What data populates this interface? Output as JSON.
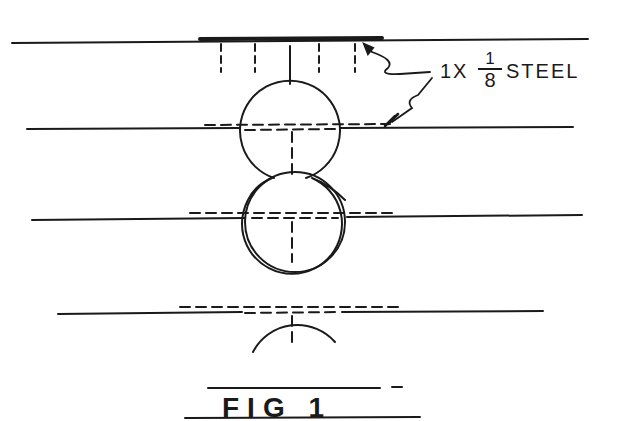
{
  "drawing": {
    "type": "technical-sketch",
    "stroke_color": "#1a1a1a",
    "background": "#ffffff"
  },
  "annotation": {
    "prefix": "1X",
    "fraction_numerator": "1",
    "fraction_denominator": "8",
    "suffix": "STEEL"
  },
  "caption": {
    "text": "FIG 1"
  }
}
